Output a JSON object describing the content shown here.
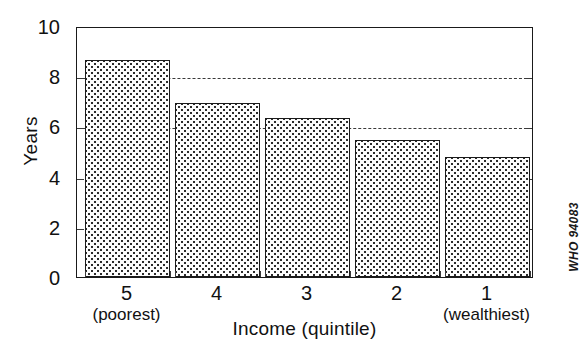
{
  "chart_data": {
    "type": "bar",
    "title": "",
    "subtitle": "",
    "xlabel": "Income (quintile)",
    "ylabel": "Years",
    "categories": [
      "5",
      "4",
      "3",
      "2",
      "1"
    ],
    "category_sublabels": [
      "(poorest)",
      "",
      "",
      "",
      "(wealthiest)"
    ],
    "values": [
      8.7,
      7.0,
      6.4,
      5.5,
      4.8
    ],
    "ylim": [
      0,
      10
    ],
    "yticks": [
      0,
      2,
      4,
      6,
      8,
      10
    ],
    "ytick_labels": [
      "0",
      "2",
      "4",
      "6",
      "8",
      "10"
    ],
    "gridlines": [
      8,
      6
    ],
    "grid": "horizontal-dashed-partial",
    "legend": "none",
    "bar_fill": "dotted-stipple",
    "bar_edge_color": "#1a1a1a",
    "annotations": [
      "WHO 94083"
    ]
  },
  "figure": {
    "credit": "WHO 94083"
  }
}
